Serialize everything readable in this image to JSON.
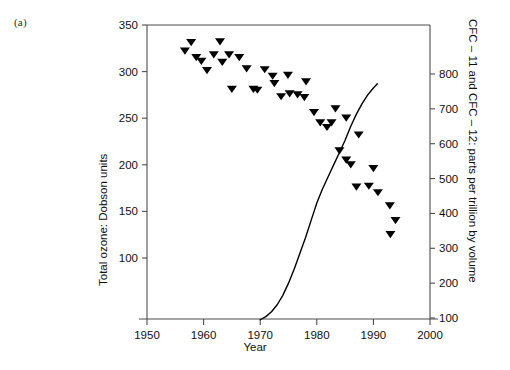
{
  "figure": {
    "panel_label": "(a)"
  },
  "chart_data": {
    "type": "scatter",
    "title": "",
    "xlabel": "Year",
    "ylabel": "Total ozone: Dobson units",
    "ylabel_right": "CFC – 11 and CFC – 12: parts per trillion by volume",
    "xlim": [
      1950,
      2000
    ],
    "ylim": [
      85,
      350
    ],
    "ylim_right": [
      85,
      860
    ],
    "xticks": [
      1950,
      1960,
      1970,
      1980,
      1990,
      2000
    ],
    "yticks_left": [
      100,
      150,
      200,
      250,
      300,
      350
    ],
    "yticks_right": [
      100,
      200,
      300,
      400,
      500,
      600,
      700,
      800
    ],
    "grid": false,
    "legend": false,
    "series": [
      {
        "name": "Total ozone",
        "type": "scatter",
        "marker": "triangle-down",
        "axis": "left",
        "color": "#000000",
        "points": [
          [
            1956.7,
            322
          ],
          [
            1957.8,
            331
          ],
          [
            1958.7,
            315
          ],
          [
            1959.6,
            311
          ],
          [
            1960.6,
            301
          ],
          [
            1961.8,
            318
          ],
          [
            1962.9,
            332
          ],
          [
            1963.3,
            310
          ],
          [
            1964.5,
            318
          ],
          [
            1966.3,
            315
          ],
          [
            1965.0,
            281
          ],
          [
            1967.6,
            303
          ],
          [
            1968.8,
            281
          ],
          [
            1969.5,
            280
          ],
          [
            1970.8,
            302
          ],
          [
            1972.5,
            287
          ],
          [
            1973.7,
            273
          ],
          [
            1972.2,
            295
          ],
          [
            1974.9,
            296
          ],
          [
            1975.2,
            276
          ],
          [
            1976.6,
            275
          ],
          [
            1977.8,
            272
          ],
          [
            1978.1,
            289
          ],
          [
            1979.5,
            256
          ],
          [
            1980.6,
            245
          ],
          [
            1981.8,
            240
          ],
          [
            1982.6,
            245
          ],
          [
            1983.3,
            260
          ],
          [
            1985.2,
            250
          ],
          [
            1987.4,
            232
          ],
          [
            1984.0,
            215
          ],
          [
            1985.2,
            205
          ],
          [
            1986.0,
            200
          ],
          [
            1990.0,
            196
          ],
          [
            1987.0,
            176
          ],
          [
            1989.2,
            177
          ],
          [
            1990.8,
            170
          ],
          [
            1992.9,
            156
          ],
          [
            1993.9,
            140
          ],
          [
            1993.0,
            125
          ]
        ]
      },
      {
        "name": "CFC-11 and CFC-12",
        "type": "line",
        "axis": "right",
        "color": "#000000",
        "points": [
          [
            1970.0,
            95
          ],
          [
            1971.0,
            104
          ],
          [
            1972.0,
            118
          ],
          [
            1973.0,
            138
          ],
          [
            1974.0,
            165
          ],
          [
            1975.0,
            200
          ],
          [
            1976.0,
            240
          ],
          [
            1977.0,
            285
          ],
          [
            1978.0,
            330
          ],
          [
            1979.0,
            380
          ],
          [
            1980.0,
            430
          ],
          [
            1981.0,
            470
          ],
          [
            1982.0,
            505
          ],
          [
            1983.0,
            540
          ],
          [
            1984.0,
            575
          ],
          [
            1985.0,
            610
          ],
          [
            1986.0,
            650
          ],
          [
            1987.0,
            685
          ],
          [
            1988.0,
            715
          ],
          [
            1989.0,
            740
          ],
          [
            1990.0,
            760
          ],
          [
            1990.7,
            772
          ]
        ]
      }
    ]
  }
}
